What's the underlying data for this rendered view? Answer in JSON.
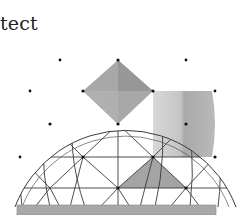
{
  "figure": {
    "caption_fragment": "tect",
    "colors": {
      "line": "#333333",
      "shade_dark": "#9a9a9a",
      "shade_mid": "#b4b4b4",
      "shade_light": "#d2d2d2",
      "base": "#a8a8a8",
      "vertex": "#111111"
    },
    "center": [
      118,
      120
    ],
    "radius": 110,
    "rings_y": [
      15,
      35,
      60,
      91,
      124,
      157,
      188
    ],
    "base_y": 207
  }
}
